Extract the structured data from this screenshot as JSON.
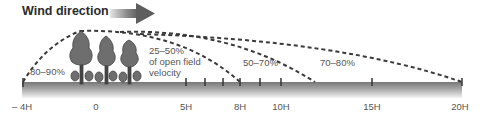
{
  "title": "Wind direction",
  "zones": [
    {
      "label": "80–90%",
      "position": "windward"
    },
    {
      "label_lines": [
        "25–50%",
        "of open field",
        "velocity"
      ],
      "position": "immediate leeward"
    },
    {
      "label": "50–70%",
      "position": "mid leeward"
    },
    {
      "label": "70–80%",
      "position": "far leeward"
    }
  ],
  "zone_labels": {
    "windward": "80–90%",
    "lee1_line1": "25–50%",
    "lee1_line2": "of open field",
    "lee1_line3": "velocity",
    "lee2": "50–70%",
    "lee3": "70–80%"
  },
  "axis": {
    "ticks": [
      {
        "label": "– 4H",
        "x": 22
      },
      {
        "label": "0",
        "x": 95
      },
      {
        "label": "5H",
        "x": 186
      },
      {
        "label": "8H",
        "x": 240
      },
      {
        "label": "10H",
        "x": 281
      },
      {
        "label": "15H",
        "x": 372
      },
      {
        "label": "20H",
        "x": 462
      }
    ]
  },
  "colors": {
    "arrow": "#6b6b6b",
    "tree": "#6e6e6e",
    "ground_top": "#7a7a7a",
    "ground_bottom": "#f2f2f2",
    "dash": "#3a3a3a",
    "text": "#555555"
  }
}
